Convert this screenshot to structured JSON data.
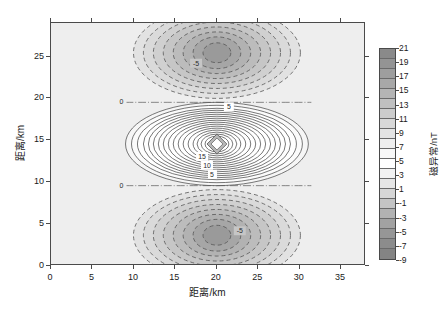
{
  "chart_data": {
    "type": "heatmap",
    "title": "",
    "subtitle": "",
    "xlabel": "距离/km",
    "ylabel": "距离/km",
    "xlim": [
      0,
      38
    ],
    "ylim": [
      0,
      29
    ],
    "xticks": [
      0,
      5,
      10,
      15,
      20,
      25,
      30,
      35
    ],
    "yticks": [
      0,
      5,
      10,
      15,
      20,
      25
    ],
    "xtick_labels": [
      "0",
      "5",
      "10",
      "15",
      "20",
      "25",
      "30",
      "35"
    ],
    "ytick_labels": [
      "0",
      "5",
      "10",
      "15",
      "20",
      "25"
    ],
    "grid": false,
    "legend": "none",
    "colorbar": {
      "label": "磁异常/nT",
      "unit": "nT",
      "vmin": -9,
      "vmax": 21,
      "step": 2,
      "ticks": [
        21,
        19,
        17,
        15,
        13,
        11,
        9,
        7,
        5,
        3,
        1,
        -1,
        -3,
        -5,
        -7,
        -9
      ],
      "tick_labels": [
        "21",
        "19",
        "17",
        "15",
        "13",
        "11",
        "9",
        "7",
        "5",
        "3",
        "1",
        "-1",
        "-3",
        "-5",
        "-7",
        "-9"
      ],
      "colors": [
        "#8a8a8a",
        "#949494",
        "#9e9e9e",
        "#a8a8a8",
        "#b4b4b4",
        "#c0c0c0",
        "#cccccc",
        "#d8d8d8",
        "#e4e4e4",
        "#efefef",
        "#f8f8f8",
        "#ffffff",
        "#f2f2f2",
        "#e6e6e6",
        "#d6d6d6",
        "#c4c4c4",
        "#b2b2b2",
        "#a2a2a2",
        "#969696",
        "#8c8c8c",
        "#848484"
      ],
      "orientation": "vertical"
    },
    "contour_levels": [
      -9,
      -7,
      -5,
      -3,
      -1,
      1,
      3,
      5,
      7,
      9,
      11,
      13,
      15,
      17,
      19,
      21
    ],
    "contour_labels": [
      "0",
      "5",
      "-5",
      "10",
      "15"
    ],
    "annotations": [
      {
        "text": "0",
        "x": 14.6,
        "y": 19.9
      },
      {
        "text": "0",
        "x": 14.6,
        "y": 10.2
      },
      {
        "text": "5",
        "x": 21.1,
        "y": 19.2
      },
      {
        "text": "5",
        "x": 19.6,
        "y": 11.1
      },
      {
        "text": "10",
        "x": 19.2,
        "y": 12.1
      },
      {
        "text": "15",
        "x": 18.6,
        "y": 13.1
      },
      {
        "text": "-5",
        "x": 17.4,
        "y": 24.1
      },
      {
        "text": "-5",
        "x": 22.6,
        "y": 3.6
      }
    ],
    "features": [
      {
        "kind": "positive-peak",
        "center_x": 20.2,
        "center_y": 15.3,
        "peak_value": 21,
        "line_style": "solid"
      },
      {
        "kind": "negative-lobe",
        "center_x": 20.2,
        "center_y": 25.2,
        "peak_value": -9,
        "line_style": "dashed"
      },
      {
        "kind": "negative-lobe",
        "center_x": 20.2,
        "center_y": 3.4,
        "peak_value": -9,
        "line_style": "dashed"
      }
    ],
    "background_value": 0,
    "background_color": "#eeeeee"
  },
  "axes": {
    "x_title": "距离/km",
    "y_title": "距离/km"
  },
  "colorbar_title": "磁异常/nT"
}
